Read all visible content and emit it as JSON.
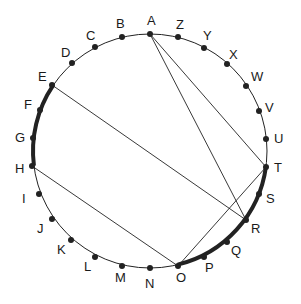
{
  "diagram": {
    "center": [
      150,
      151
    ],
    "radius": 117,
    "colors": {
      "stroke": "#222222",
      "background": "#ffffff"
    },
    "points": [
      {
        "id": "A",
        "x": 150,
        "y": 34,
        "lx": 147,
        "ly": 25
      },
      {
        "id": "Z",
        "x": 178,
        "y": 37,
        "lx": 176,
        "ly": 29
      },
      {
        "id": "Y",
        "x": 204,
        "y": 48,
        "lx": 203,
        "ly": 40
      },
      {
        "id": "X",
        "x": 227,
        "y": 64,
        "lx": 229,
        "ly": 59
      },
      {
        "id": "W",
        "x": 246,
        "y": 86,
        "lx": 251,
        "ly": 81
      },
      {
        "id": "V",
        "x": 259,
        "y": 111,
        "lx": 265,
        "ly": 112
      },
      {
        "id": "U",
        "x": 266,
        "y": 139,
        "lx": 274,
        "ly": 143
      },
      {
        "id": "T",
        "x": 266,
        "y": 167,
        "lx": 274,
        "ly": 172
      },
      {
        "id": "S",
        "x": 259,
        "y": 194,
        "lx": 266,
        "ly": 203
      },
      {
        "id": "R",
        "x": 246,
        "y": 220,
        "lx": 251,
        "ly": 233
      },
      {
        "id": "Q",
        "x": 227,
        "y": 242,
        "lx": 231,
        "ly": 255
      },
      {
        "id": "P",
        "x": 204,
        "y": 257,
        "lx": 205,
        "ly": 272
      },
      {
        "id": "O",
        "x": 178,
        "y": 266,
        "lx": 176,
        "ly": 282
      },
      {
        "id": "N",
        "x": 150,
        "y": 268,
        "lx": 145,
        "ly": 288
      },
      {
        "id": "M",
        "x": 122,
        "y": 266,
        "lx": 115,
        "ly": 282
      },
      {
        "id": "L",
        "x": 95,
        "y": 257,
        "lx": 84,
        "ly": 271
      },
      {
        "id": "K",
        "x": 71,
        "y": 240,
        "lx": 57,
        "ly": 254
      },
      {
        "id": "J",
        "x": 52,
        "y": 219,
        "lx": 37,
        "ly": 233
      },
      {
        "id": "I",
        "x": 39,
        "y": 194,
        "lx": 22,
        "ly": 203
      },
      {
        "id": "H",
        "x": 32,
        "y": 166,
        "lx": 15,
        "ly": 173
      },
      {
        "id": "G",
        "x": 33,
        "y": 138,
        "lx": 15,
        "ly": 142
      },
      {
        "id": "F",
        "x": 40,
        "y": 110,
        "lx": 24,
        "ly": 109
      },
      {
        "id": "E",
        "x": 52,
        "y": 85,
        "lx": 38,
        "ly": 81
      },
      {
        "id": "D",
        "x": 72,
        "y": 63,
        "lx": 61,
        "ly": 57
      },
      {
        "id": "C",
        "x": 95,
        "y": 47,
        "lx": 86,
        "ly": 40
      },
      {
        "id": "B",
        "x": 122,
        "y": 37,
        "lx": 116,
        "ly": 28
      }
    ],
    "chords": [
      {
        "from": "A",
        "to": "T"
      },
      {
        "from": "A",
        "to": "R"
      },
      {
        "from": "E",
        "to": "R"
      },
      {
        "from": "H",
        "to": "O"
      },
      {
        "from": "O",
        "to": "T"
      }
    ],
    "thick_arcs": [
      {
        "from": "E",
        "to": "H"
      },
      {
        "from": "O",
        "to": "T"
      }
    ]
  }
}
